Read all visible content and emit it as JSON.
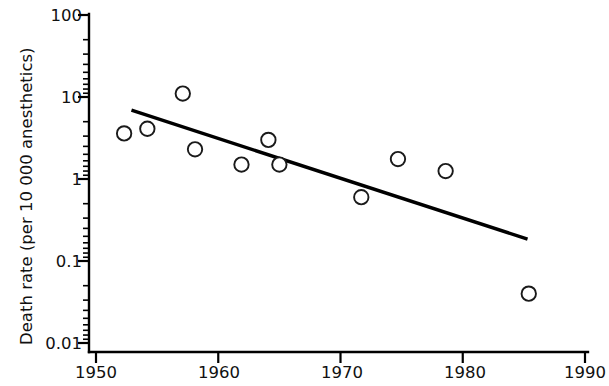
{
  "chart_data": {
    "type": "scatter",
    "title": "",
    "xlabel": "",
    "ylabel": "Death rate (per 10 000 anesthetics)",
    "yscale": "log",
    "xlim": [
      1950,
      1990
    ],
    "ylim": [
      0.01,
      100
    ],
    "grid": false,
    "legend": null,
    "x_ticks": [
      "1950",
      "1960",
      "1970",
      "1980",
      "1990"
    ],
    "x_tick_values": [
      1950,
      1960,
      1970,
      1980,
      1990
    ],
    "y_ticks": [
      "100",
      "10",
      "1",
      "0.1",
      "0.01"
    ],
    "y_tick_values": [
      100,
      10,
      1,
      0.1,
      0.01
    ],
    "series": [
      {
        "name": "Observed death rate",
        "marker": "open-circle",
        "x": [
          1952.3,
          1954.2,
          1957.1,
          1958.1,
          1961.9,
          1964.1,
          1965.0,
          1971.7,
          1974.7,
          1978.6,
          1985.4
        ],
        "y": [
          3.6,
          4.1,
          11.0,
          2.3,
          1.5,
          3.0,
          1.5,
          0.6,
          1.75,
          1.25,
          0.04
        ]
      },
      {
        "name": "Fitted trend line",
        "marker": "none",
        "line": {
          "x_start": 1952.9,
          "y_start": 6.9,
          "x_end": 1985.3,
          "y_end": 0.185
        }
      }
    ]
  }
}
